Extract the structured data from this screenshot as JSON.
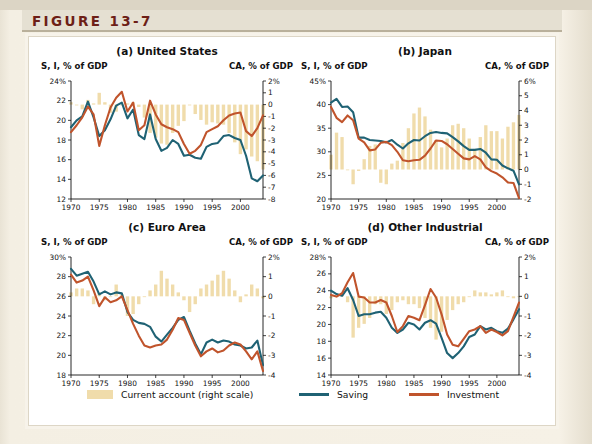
{
  "figure": {
    "label": "FIGURE 13-7",
    "accent_color": "#6d1f17",
    "page_bg": "#f4efe3"
  },
  "colors": {
    "bar": "#f0dcab",
    "saving": "#1f6274",
    "investment": "#c0542c",
    "axis": "#111111"
  },
  "legend": {
    "items": [
      {
        "name": "current-account",
        "label": "Current account (right scale)",
        "swatch": "bar",
        "color": "#f0dcab"
      },
      {
        "name": "saving",
        "label": "Saving",
        "swatch": "line",
        "color": "#1f6274"
      },
      {
        "name": "investment",
        "label": "Investment",
        "swatch": "line",
        "color": "#c0542c"
      }
    ]
  },
  "source_note": "",
  "chart_data": [
    {
      "id": "panel-a",
      "type": "line",
      "title": "(a) United States",
      "ylabel": "S, I, % of GDP",
      "y2label": "CA, % of GDP",
      "xlabel": "",
      "x": [
        1970,
        1971,
        1972,
        1973,
        1974,
        1975,
        1976,
        1977,
        1978,
        1979,
        1980,
        1981,
        1982,
        1983,
        1984,
        1985,
        1986,
        1987,
        1988,
        1989,
        1990,
        1991,
        1992,
        1993,
        1994,
        1995,
        1996,
        1997,
        1998,
        1999,
        2000,
        2001,
        2002,
        2003,
        2004
      ],
      "xticks": [
        1970,
        1975,
        1980,
        1985,
        1990,
        1995,
        2000
      ],
      "ylim": [
        12,
        24
      ],
      "yticks": [
        12,
        14,
        16,
        18,
        20,
        22,
        24
      ],
      "ytick_labels": [
        "12",
        "14",
        "16",
        "18",
        "20",
        "22",
        "24%"
      ],
      "y2lim": [
        -8,
        2
      ],
      "y2ticks": [
        -8,
        -7,
        -6,
        -5,
        -4,
        -3,
        -2,
        -1,
        0,
        1,
        2
      ],
      "y2tick_labels": [
        "-8",
        "-7",
        "-6",
        "-5",
        "-4",
        "-3",
        "-2",
        "-1",
        "0",
        "1",
        "2%"
      ],
      "grid": false,
      "series": [
        {
          "name": "Saving",
          "axis": "left",
          "color": "#1f6274",
          "values": [
            19.3,
            20.0,
            20.4,
            21.9,
            20.3,
            18.4,
            19.0,
            20.1,
            21.5,
            21.8,
            20.2,
            21.1,
            18.5,
            18.1,
            20.6,
            18.1,
            16.9,
            17.2,
            18.0,
            17.6,
            16.4,
            16.5,
            16.2,
            16.1,
            17.3,
            17.6,
            17.7,
            18.4,
            18.5,
            18.2,
            18.0,
            16.4,
            14.1,
            13.8,
            14.4
          ]
        },
        {
          "name": "Investment",
          "axis": "left",
          "color": "#c0542c",
          "values": [
            18.8,
            19.5,
            20.3,
            21.4,
            20.6,
            17.4,
            19.5,
            21.3,
            22.3,
            22.9,
            20.9,
            21.8,
            19.0,
            19.5,
            22.0,
            20.6,
            19.6,
            19.3,
            19.1,
            18.8,
            17.6,
            16.6,
            16.9,
            17.5,
            18.8,
            19.1,
            19.4,
            20.0,
            20.5,
            20.7,
            20.8,
            18.9,
            18.4,
            19.2,
            20.5
          ]
        },
        {
          "name": "Current account",
          "axis": "right",
          "type": "bar",
          "color": "#f0dcab",
          "values": [
            0.2,
            0.0,
            -0.4,
            0.4,
            0.1,
            1.0,
            0.2,
            -0.7,
            -0.6,
            0.0,
            0.1,
            0.2,
            -0.2,
            -1.1,
            -2.4,
            -2.8,
            -3.3,
            -3.4,
            -2.4,
            -1.8,
            -1.4,
            0.0,
            -0.8,
            -1.3,
            -1.7,
            -1.5,
            -1.6,
            -1.7,
            -2.4,
            -3.2,
            -4.2,
            -3.8,
            -4.4,
            -4.8,
            -5.5
          ]
        }
      ]
    },
    {
      "id": "panel-b",
      "type": "line",
      "title": "(b) Japan",
      "ylabel": "S, I, % of GDP",
      "y2label": "CA, % of GDP",
      "xlabel": "",
      "x": [
        1970,
        1971,
        1972,
        1973,
        1974,
        1975,
        1976,
        1977,
        1978,
        1979,
        1980,
        1981,
        1982,
        1983,
        1984,
        1985,
        1986,
        1987,
        1988,
        1989,
        1990,
        1991,
        1992,
        1993,
        1994,
        1995,
        1996,
        1997,
        1998,
        1999,
        2000,
        2001,
        2002,
        2003,
        2004
      ],
      "xticks": [
        1970,
        1975,
        1980,
        1985,
        1990,
        1995,
        2000
      ],
      "ylim": [
        20,
        45
      ],
      "yticks": [
        20,
        25,
        30,
        35,
        40,
        45
      ],
      "ytick_labels": [
        "20",
        "25",
        "30",
        "35",
        "40",
        "45%"
      ],
      "y2lim": [
        -2,
        6
      ],
      "y2ticks": [
        -2,
        -1,
        0,
        1,
        2,
        3,
        4,
        5,
        6
      ],
      "y2tick_labels": [
        "-2",
        "-1",
        "0",
        "1",
        "2",
        "3",
        "4",
        "5",
        "6%"
      ],
      "grid": false,
      "series": [
        {
          "name": "Saving",
          "axis": "left",
          "color": "#1f6274",
          "values": [
            40.4,
            41.2,
            39.5,
            39.6,
            38.4,
            33.0,
            33.0,
            32.5,
            32.4,
            32.3,
            32.0,
            32.5,
            31.5,
            30.7,
            31.8,
            32.5,
            32.4,
            33.3,
            34.0,
            34.2,
            34.0,
            33.9,
            33.1,
            32.2,
            31.2,
            30.4,
            30.4,
            30.6,
            29.8,
            28.4,
            28.3,
            27.1,
            26.5,
            26.0,
            23.1
          ]
        },
        {
          "name": "Investment",
          "axis": "left",
          "color": "#c0542c",
          "values": [
            39.5,
            37.2,
            36.3,
            37.7,
            36.7,
            32.8,
            32.0,
            30.3,
            30.5,
            31.9,
            32.1,
            31.4,
            30.0,
            28.2,
            28.0,
            28.2,
            28.3,
            29.2,
            30.7,
            32.4,
            32.3,
            31.6,
            30.6,
            29.6,
            28.6,
            28.4,
            29.1,
            28.4,
            26.7,
            25.9,
            25.4,
            24.6,
            23.5,
            23.4,
            20.2
          ]
        },
        {
          "name": "Current account",
          "axis": "right",
          "type": "bar",
          "color": "#f0dcab",
          "values": [
            1.0,
            2.5,
            2.2,
            0.0,
            -1.0,
            -0.1,
            0.7,
            1.6,
            1.7,
            -0.9,
            -1.0,
            0.4,
            0.6,
            1.8,
            2.8,
            3.8,
            4.2,
            3.6,
            2.7,
            2.0,
            1.5,
            2.1,
            3.0,
            3.1,
            2.8,
            2.1,
            1.4,
            2.2,
            3.0,
            2.6,
            2.6,
            2.1,
            2.9,
            3.2,
            3.7
          ]
        }
      ]
    },
    {
      "id": "panel-c",
      "type": "line",
      "title": "(c) Euro Area",
      "ylabel": "S, I, % of GDP",
      "y2label": "CA, % of GDP",
      "xlabel": "",
      "x": [
        1970,
        1971,
        1972,
        1973,
        1974,
        1975,
        1976,
        1977,
        1978,
        1979,
        1980,
        1981,
        1982,
        1983,
        1984,
        1985,
        1986,
        1987,
        1988,
        1989,
        1990,
        1991,
        1992,
        1993,
        1994,
        1995,
        1996,
        1997,
        1998,
        1999,
        2000,
        2001,
        2002,
        2003,
        2004
      ],
      "xticks": [
        1970,
        1975,
        1980,
        1985,
        1990,
        1995,
        2000
      ],
      "ylim": [
        18,
        30
      ],
      "yticks": [
        18,
        20,
        22,
        24,
        26,
        28,
        30
      ],
      "ytick_labels": [
        "18",
        "20",
        "22",
        "24",
        "26",
        "28",
        "30%"
      ],
      "y2lim": [
        -4,
        2
      ],
      "y2ticks": [
        -4,
        -3,
        -2,
        -1,
        0,
        1,
        2
      ],
      "y2tick_labels": [
        "-4",
        "-3",
        "-2",
        "-1",
        "0",
        "1",
        "2%"
      ],
      "grid": false,
      "series": [
        {
          "name": "Saving",
          "axis": "left",
          "color": "#1f6274",
          "values": [
            28.8,
            28.1,
            28.3,
            28.5,
            27.5,
            26.2,
            26.5,
            26.2,
            26.4,
            26.3,
            24.4,
            23.6,
            23.3,
            23.2,
            22.9,
            21.9,
            21.4,
            22.1,
            22.8,
            23.6,
            23.9,
            22.5,
            21.2,
            20.1,
            21.3,
            21.6,
            21.3,
            21.5,
            21.4,
            21.1,
            21.0,
            20.7,
            20.8,
            21.5,
            19.0
          ]
        },
        {
          "name": "Investment",
          "axis": "left",
          "color": "#c0542c",
          "values": [
            28.2,
            27.4,
            27.6,
            28.0,
            26.6,
            25.0,
            25.9,
            25.4,
            25.6,
            26.0,
            24.6,
            23.2,
            22.0,
            21.0,
            20.8,
            21.0,
            21.1,
            21.6,
            22.6,
            23.8,
            23.6,
            22.3,
            21.0,
            19.9,
            20.4,
            20.7,
            20.3,
            20.5,
            21.0,
            21.3,
            21.1,
            20.4,
            19.6,
            20.4,
            18.4
          ]
        },
        {
          "name": "Current account",
          "axis": "right",
          "type": "bar",
          "color": "#f0dcab",
          "values": [
            0.2,
            0.4,
            0.4,
            0.3,
            -0.4,
            0.2,
            -0.2,
            0.0,
            0.6,
            0.1,
            -1.0,
            -0.9,
            -0.4,
            0.0,
            0.3,
            0.6,
            1.3,
            0.9,
            0.6,
            0.2,
            -0.2,
            -0.8,
            -0.4,
            0.4,
            0.6,
            0.8,
            1.1,
            1.3,
            0.9,
            0.3,
            -0.3,
            0.1,
            0.6,
            0.4,
            -0.1
          ]
        }
      ]
    },
    {
      "id": "panel-d",
      "type": "line",
      "title": "(d) Other Industrial",
      "ylabel": "S, I, % of GDP",
      "y2label": "CA, % of GDP",
      "xlabel": "",
      "x": [
        1970,
        1971,
        1972,
        1973,
        1974,
        1975,
        1976,
        1977,
        1978,
        1979,
        1980,
        1981,
        1982,
        1983,
        1984,
        1985,
        1986,
        1987,
        1988,
        1989,
        1990,
        1991,
        1992,
        1993,
        1994,
        1995,
        1996,
        1997,
        1998,
        1999,
        2000,
        2001,
        2002,
        2003,
        2004
      ],
      "xticks": [
        1970,
        1975,
        1980,
        1985,
        1990,
        1995,
        2000
      ],
      "ylim": [
        14,
        28
      ],
      "yticks": [
        14,
        16,
        18,
        20,
        22,
        24,
        26,
        28
      ],
      "ytick_labels": [
        "14",
        "16",
        "18",
        "20",
        "22",
        "24",
        "26",
        "28%"
      ],
      "y2lim": [
        -4,
        2
      ],
      "y2ticks": [
        -4,
        -3,
        -2,
        -1,
        0,
        1,
        2
      ],
      "y2tick_labels": [
        "-4",
        "-3",
        "-2",
        "-1",
        "0",
        "1",
        "2%"
      ],
      "grid": false,
      "series": [
        {
          "name": "Saving",
          "axis": "left",
          "color": "#1f6274",
          "values": [
            24.0,
            23.6,
            23.4,
            24.3,
            22.9,
            21.0,
            21.2,
            21.2,
            21.4,
            21.5,
            20.8,
            19.6,
            19.0,
            19.4,
            20.2,
            20.0,
            19.4,
            20.2,
            20.5,
            20.1,
            18.4,
            16.6,
            16.0,
            16.6,
            17.4,
            18.5,
            18.8,
            19.8,
            19.4,
            19.6,
            19.2,
            19.0,
            19.5,
            20.6,
            21.8
          ]
        },
        {
          "name": "Investment",
          "axis": "left",
          "color": "#c0542c",
          "values": [
            23.5,
            23.3,
            23.7,
            25.0,
            26.1,
            23.3,
            23.2,
            22.6,
            22.6,
            22.9,
            22.6,
            21.0,
            19.1,
            19.8,
            21.0,
            20.8,
            20.5,
            22.3,
            24.2,
            23.2,
            21.2,
            18.8,
            17.6,
            17.4,
            18.3,
            19.2,
            19.4,
            19.8,
            19.0,
            19.4,
            19.1,
            18.7,
            19.2,
            20.9,
            22.6
          ]
        },
        {
          "name": "Current account",
          "axis": "right",
          "type": "bar",
          "color": "#f0dcab",
          "values": [
            -0.1,
            0.0,
            0.1,
            -0.3,
            -2.1,
            -1.6,
            -1.4,
            -1.1,
            -0.4,
            -0.4,
            -0.9,
            -0.7,
            -0.3,
            -0.2,
            -0.4,
            -0.4,
            -0.6,
            -1.1,
            -1.6,
            -2.2,
            -1.8,
            -1.2,
            -0.7,
            -0.4,
            -0.3,
            0.0,
            0.3,
            0.2,
            0.2,
            0.1,
            0.2,
            0.3,
            0.0,
            -0.1,
            0.0
          ]
        }
      ]
    }
  ]
}
